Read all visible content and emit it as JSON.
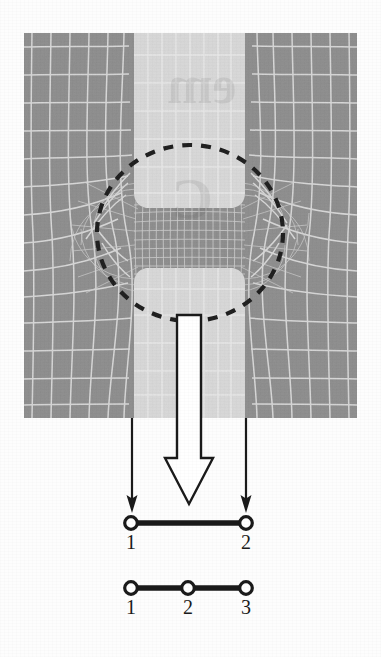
{
  "figure": {
    "domain": "Diagram",
    "kind": "finite-element-contact-mesh-figure",
    "caption": "",
    "page_background": "#fdfdfd"
  },
  "mesh_panel": {
    "name": "deformed-finite-element-mesh",
    "x": 24,
    "y": 33,
    "width": 333,
    "height": 385,
    "colors": {
      "dark_material": "#8d8d8d",
      "light_material": "#d8d8d8",
      "mesh_line": "#e8e8e8",
      "mesh_line_dark_region": "#d6d6d6"
    },
    "light_band": {
      "x_start": 134,
      "x_end": 245,
      "label": "vertical-light-strip"
    },
    "contact_gap": {
      "label": "contact-interface-gap",
      "center_y": 232
    },
    "detail_circle": {
      "name": "dashed-detail-circle",
      "cx": 190,
      "cy": 233,
      "rx": 93,
      "ry": 88,
      "stroke": "#1a1a1a",
      "dash": "10 9",
      "stroke_width": 4
    },
    "watermark_text": "emk"
  },
  "load_arrows": {
    "hollow_arrow": {
      "name": "applied-load-arrow",
      "label": "",
      "shaft_x_left": 177,
      "shaft_x_right": 201,
      "shaft_top": 327,
      "head_top": 458,
      "tip_y": 504,
      "head_half_width": 24,
      "fill": "#ffffff",
      "stroke": "#1a1a1a",
      "stroke_width": 2.4
    },
    "thin_arrows": [
      {
        "name": "reaction-arrow-left",
        "x": 132,
        "y_start": 418,
        "y_end": 512
      },
      {
        "name": "reaction-arrow-right",
        "x": 246,
        "y_start": 418,
        "y_end": 512
      }
    ],
    "thin_arrow_color": "#1a1a1a"
  },
  "elements": [
    {
      "name": "two-node-contact-element",
      "type": "linear",
      "y": 523,
      "line_x_start": 131,
      "line_x_end": 246,
      "nodes": [
        {
          "id": "1",
          "label": "1",
          "x": 131
        },
        {
          "id": "2",
          "label": "2",
          "x": 246
        }
      ],
      "label_y": 532
    },
    {
      "name": "three-node-contact-element",
      "type": "quadratic",
      "y": 588,
      "line_x_start": 131,
      "line_x_end": 246,
      "nodes": [
        {
          "id": "1",
          "label": "1",
          "x": 131
        },
        {
          "id": "2",
          "label": "2",
          "x": 188
        },
        {
          "id": "3",
          "label": "3",
          "x": 246
        }
      ],
      "label_y": 597
    }
  ],
  "element_style": {
    "line_color": "#1a1a1a",
    "line_width": 5,
    "node_outer_radius": 6.5,
    "node_ring_width": 3,
    "node_fill": "#ffffff",
    "node_stroke": "#1a1a1a"
  }
}
